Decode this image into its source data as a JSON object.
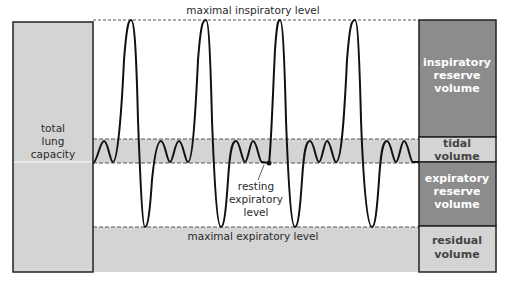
{
  "diagram": {
    "type": "spirogram-lung-volumes",
    "labels": {
      "max_inspiratory": "maximal inspiratory level",
      "max_expiratory": "maximal expiratory level",
      "resting_expiratory": [
        "resting",
        "expiratory",
        "level"
      ],
      "total_lung_capacity": [
        "total",
        "lung",
        "capacity"
      ]
    },
    "volumes": [
      {
        "name": "inspiratory reserve volume",
        "lines": [
          "inspiratory",
          "reserve",
          "volume"
        ],
        "fill": "#8c8c8c",
        "text_color": "#ffffff"
      },
      {
        "name": "tidal volume",
        "lines": [
          "tidal",
          "volume"
        ],
        "fill": "#d4d4d4",
        "text_color": "#444444"
      },
      {
        "name": "expiratory reserve volume",
        "lines": [
          "expiratory",
          "reserve",
          "volume"
        ],
        "fill": "#8c8c8c",
        "text_color": "#ffffff"
      },
      {
        "name": "residual volume",
        "lines": [
          "residual",
          "volume"
        ],
        "fill": "#d4d4d4",
        "text_color": "#444444"
      }
    ],
    "colors": {
      "light_gray": "#d4d4d4",
      "dark_gray": "#8c8c8c",
      "line": "#1a1a1a",
      "dash": "#555555"
    },
    "levels_px": {
      "max_inspiratory_y": 20,
      "tidal_top_y": 139,
      "resting_expiratory_y": 163,
      "max_expiratory_y": 227,
      "bottom_y": 272
    }
  }
}
